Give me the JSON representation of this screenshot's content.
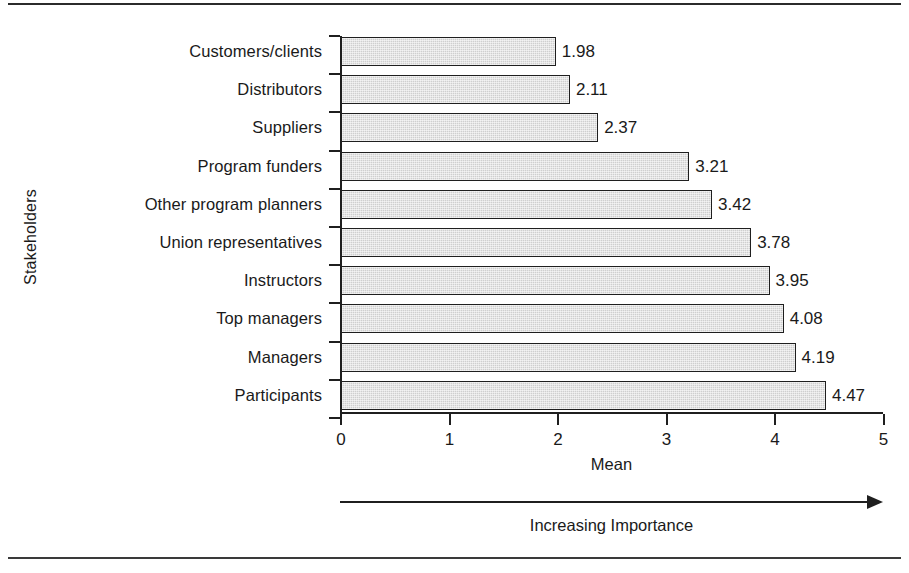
{
  "figure": {
    "y_axis_title": "Stakeholders",
    "x_axis_title": "Mean",
    "importance_caption": "Increasing Importance",
    "arrow_icon": "right-arrow-icon",
    "bar_fill_color": "#cfcfcf",
    "bar_outline_color": "#1f1f1f",
    "axis_color": "#1f1f1f",
    "background_color": "#ffffff"
  },
  "chart_data": {
    "type": "bar",
    "orientation": "horizontal",
    "title": "",
    "subtitle": "",
    "xlabel": "Mean",
    "ylabel": "Stakeholders",
    "xlim": [
      0,
      5
    ],
    "xticks": [
      "0",
      "1",
      "2",
      "3",
      "4",
      "5"
    ],
    "xtick_values": [
      0,
      1,
      2,
      3,
      4,
      5
    ],
    "grid": false,
    "legend": false,
    "legend_position": "none",
    "annotations": [
      "Increasing Importance"
    ],
    "data_labels": true,
    "categories": [
      "Customers/clients",
      "Distributors",
      "Suppliers",
      "Program funders",
      "Other program planners",
      "Union representatives",
      "Instructors",
      "Top managers",
      "Managers",
      "Participants"
    ],
    "values": [
      1.98,
      2.11,
      2.37,
      3.21,
      3.42,
      3.78,
      3.95,
      4.08,
      4.19,
      4.47
    ],
    "value_labels": [
      "1.98",
      "2.11",
      "2.37",
      "3.21",
      "3.42",
      "3.78",
      "3.95",
      "4.08",
      "4.19",
      "4.47"
    ]
  }
}
